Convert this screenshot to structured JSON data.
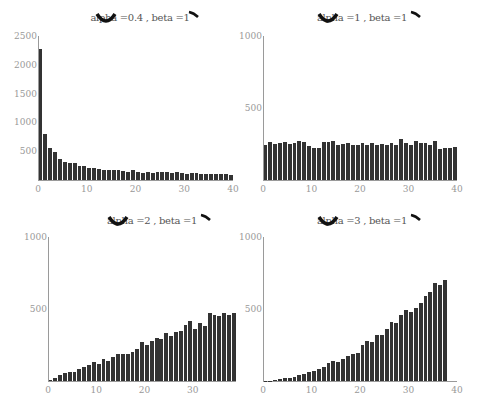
{
  "chart_data": [
    {
      "type": "bar",
      "title": "alpha =0.4 , beta =1",
      "xlabel": "",
      "ylabel": "",
      "xticks": [
        0,
        10,
        20,
        30,
        40
      ],
      "yticks": [
        500,
        1000,
        1500,
        2000,
        2500
      ],
      "xlim": [
        0,
        40
      ],
      "ylim": [
        0,
        2500
      ],
      "grid": false,
      "x": [
        0,
        1,
        2,
        3,
        4,
        5,
        6,
        7,
        8,
        9,
        10,
        11,
        12,
        13,
        14,
        15,
        16,
        17,
        18,
        19,
        20,
        21,
        22,
        23,
        24,
        25,
        26,
        27,
        28,
        29,
        30,
        31,
        32,
        33,
        34,
        35,
        36,
        37,
        38,
        39
      ],
      "values": [
        2275,
        790,
        560,
        480,
        360,
        310,
        290,
        290,
        250,
        240,
        200,
        200,
        190,
        180,
        180,
        180,
        180,
        160,
        140,
        170,
        140,
        120,
        140,
        120,
        140,
        140,
        140,
        120,
        140,
        120,
        110,
        120,
        120,
        100,
        100,
        100,
        100,
        100,
        100,
        90
      ]
    },
    {
      "type": "bar",
      "title": "alpha =1 , beta =1",
      "xlabel": "",
      "ylabel": "",
      "xticks": [
        0,
        10,
        20,
        30,
        40
      ],
      "yticks": [
        500,
        1000
      ],
      "xlim": [
        0,
        40
      ],
      "ylim": [
        0,
        1000
      ],
      "grid": false,
      "x": [
        0,
        1,
        2,
        3,
        4,
        5,
        6,
        7,
        8,
        9,
        10,
        11,
        12,
        13,
        14,
        15,
        16,
        17,
        18,
        19,
        20,
        21,
        22,
        23,
        24,
        25,
        26,
        27,
        28,
        29,
        30,
        31,
        32,
        33,
        34,
        35,
        36,
        37,
        38,
        39
      ],
      "values": [
        245,
        265,
        250,
        260,
        265,
        250,
        260,
        270,
        265,
        235,
        220,
        225,
        265,
        265,
        270,
        240,
        250,
        260,
        240,
        245,
        260,
        240,
        260,
        245,
        250,
        240,
        260,
        240,
        285,
        260,
        245,
        270,
        260,
        260,
        245,
        270,
        215,
        225,
        225,
        230
      ]
    },
    {
      "type": "bar",
      "title": "alpha =2 , beta =1",
      "xlabel": "",
      "ylabel": "",
      "xticks": [
        0,
        10,
        20,
        30
      ],
      "yticks": [
        500,
        1000
      ],
      "xlim": [
        0,
        39
      ],
      "ylim": [
        0,
        1000
      ],
      "grid": false,
      "x": [
        0,
        1,
        2,
        3,
        4,
        5,
        6,
        7,
        8,
        9,
        10,
        11,
        12,
        13,
        14,
        15,
        16,
        17,
        18,
        19,
        20,
        21,
        22,
        23,
        24,
        25,
        26,
        27,
        28,
        29,
        30,
        31,
        32,
        33,
        34,
        35,
        36,
        37,
        38
      ],
      "values": [
        10,
        20,
        40,
        55,
        65,
        65,
        80,
        100,
        110,
        130,
        120,
        150,
        140,
        170,
        190,
        190,
        190,
        200,
        220,
        270,
        250,
        280,
        300,
        290,
        330,
        310,
        340,
        350,
        390,
        420,
        360,
        400,
        380,
        470,
        460,
        450,
        470,
        460,
        470
      ]
    },
    {
      "type": "bar",
      "title": "alpha =3 , beta =1",
      "xlabel": "",
      "ylabel": "",
      "xticks": [
        0,
        10,
        20,
        30,
        40
      ],
      "yticks": [
        500,
        1000
      ],
      "xlim": [
        0,
        40
      ],
      "ylim": [
        0,
        1000
      ],
      "grid": false,
      "x": [
        0,
        1,
        2,
        3,
        4,
        5,
        6,
        7,
        8,
        9,
        10,
        11,
        12,
        13,
        14,
        15,
        16,
        17,
        18,
        19,
        20,
        21,
        22,
        23,
        24,
        25,
        26,
        27,
        28,
        29,
        30,
        31,
        32,
        33,
        34,
        35,
        36,
        37,
        38
      ],
      "values": [
        3,
        3,
        10,
        12,
        20,
        18,
        30,
        45,
        50,
        60,
        70,
        80,
        100,
        125,
        140,
        135,
        150,
        175,
        190,
        195,
        250,
        280,
        270,
        320,
        320,
        360,
        410,
        400,
        460,
        490,
        480,
        510,
        540,
        590,
        620,
        680,
        670,
        700,
        0
      ]
    }
  ],
  "panels": [
    {
      "title": "alpha =0.4 , beta =1"
    },
    {
      "title": "alpha =1 , beta =1"
    },
    {
      "title": "alpha =2 , beta =1"
    },
    {
      "title": "alpha =3 , beta =1"
    }
  ],
  "colors": {
    "bar": "#333333",
    "spine": "#9a9a9a",
    "tick_text": "#999999",
    "title_text": "#555555"
  }
}
